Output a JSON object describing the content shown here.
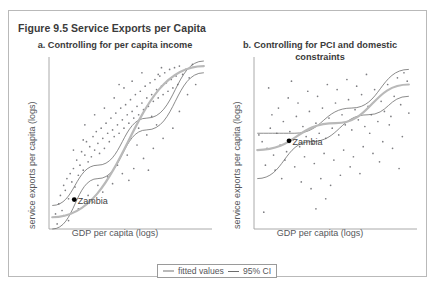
{
  "figure": {
    "title": "Figure 9.5 Service Exports per Capita",
    "border_color": "#b9b9b9"
  },
  "legend": {
    "fitted_label": "fitted values",
    "ci_label": "95% CI",
    "fitted_color": "#b9b9b9",
    "ci_color": "#6d6d6d"
  },
  "panels": [
    {
      "id": "a",
      "title": "a. Controlling for per capita income",
      "xlabel": "GDP per capita (logs)",
      "ylabel": "service exports per capita (logs)",
      "annotation": "Zambia"
    },
    {
      "id": "b",
      "title": "b. Controlling for PCI and domestic constraints",
      "xlabel": "GDP per capita (logs)",
      "ylabel": "service exports per capita (logs)",
      "annotation": "Zambia"
    }
  ],
  "chart_data": [
    {
      "type": "scatter",
      "panel": "a",
      "title": "a. Controlling for per capita income",
      "xlabel": "GDP per capita (logs)",
      "ylabel": "service exports per capita (logs)",
      "grid": false,
      "legend_position": "bottom-center",
      "xlim": [
        0,
        1
      ],
      "ylim": [
        0,
        1
      ],
      "points": [
        [
          0.04,
          0.09
        ],
        [
          0.06,
          0.15
        ],
        [
          0.07,
          0.2
        ],
        [
          0.08,
          0.11
        ],
        [
          0.09,
          0.26
        ],
        [
          0.1,
          0.23
        ],
        [
          0.11,
          0.3
        ],
        [
          0.12,
          0.18
        ],
        [
          0.13,
          0.33
        ],
        [
          0.14,
          0.28
        ],
        [
          0.15,
          0.36
        ],
        [
          0.16,
          0.25
        ],
        [
          0.17,
          0.41
        ],
        [
          0.18,
          0.32
        ],
        [
          0.19,
          0.38
        ],
        [
          0.2,
          0.46
        ],
        [
          0.21,
          0.35
        ],
        [
          0.22,
          0.44
        ],
        [
          0.23,
          0.52
        ],
        [
          0.24,
          0.4
        ],
        [
          0.25,
          0.49
        ],
        [
          0.26,
          0.43
        ],
        [
          0.27,
          0.55
        ],
        [
          0.28,
          0.47
        ],
        [
          0.29,
          0.58
        ],
        [
          0.3,
          0.51
        ],
        [
          0.31,
          0.45
        ],
        [
          0.32,
          0.6
        ],
        [
          0.33,
          0.54
        ],
        [
          0.34,
          0.48
        ],
        [
          0.35,
          0.63
        ],
        [
          0.36,
          0.57
        ],
        [
          0.37,
          0.52
        ],
        [
          0.38,
          0.66
        ],
        [
          0.39,
          0.59
        ],
        [
          0.4,
          0.55
        ],
        [
          0.41,
          0.69
        ],
        [
          0.42,
          0.62
        ],
        [
          0.43,
          0.57
        ],
        [
          0.44,
          0.72
        ],
        [
          0.45,
          0.65
        ],
        [
          0.46,
          0.6
        ],
        [
          0.47,
          0.74
        ],
        [
          0.48,
          0.68
        ],
        [
          0.49,
          0.63
        ],
        [
          0.5,
          0.77
        ],
        [
          0.51,
          0.7
        ],
        [
          0.52,
          0.66
        ],
        [
          0.53,
          0.8
        ],
        [
          0.54,
          0.73
        ],
        [
          0.55,
          0.68
        ],
        [
          0.56,
          0.82
        ],
        [
          0.57,
          0.75
        ],
        [
          0.58,
          0.71
        ],
        [
          0.59,
          0.85
        ],
        [
          0.6,
          0.78
        ],
        [
          0.61,
          0.73
        ],
        [
          0.62,
          0.87
        ],
        [
          0.63,
          0.8
        ],
        [
          0.64,
          0.76
        ],
        [
          0.65,
          0.89
        ],
        [
          0.66,
          0.83
        ],
        [
          0.67,
          0.78
        ],
        [
          0.68,
          0.91
        ],
        [
          0.69,
          0.85
        ],
        [
          0.7,
          0.8
        ],
        [
          0.71,
          0.93
        ],
        [
          0.72,
          0.87
        ],
        [
          0.73,
          0.82
        ],
        [
          0.74,
          0.95
        ],
        [
          0.75,
          0.89
        ],
        [
          0.76,
          0.84
        ],
        [
          0.77,
          0.96
        ],
        [
          0.78,
          0.91
        ],
        [
          0.79,
          0.86
        ],
        [
          0.8,
          0.97
        ],
        [
          0.82,
          0.92
        ],
        [
          0.84,
          0.95
        ],
        [
          0.86,
          0.9
        ],
        [
          0.88,
          0.98
        ],
        [
          0.12,
          0.05
        ],
        [
          0.18,
          0.12
        ],
        [
          0.24,
          0.2
        ],
        [
          0.3,
          0.26
        ],
        [
          0.36,
          0.31
        ],
        [
          0.42,
          0.38
        ],
        [
          0.48,
          0.44
        ],
        [
          0.54,
          0.5
        ],
        [
          0.6,
          0.56
        ],
        [
          0.66,
          0.62
        ],
        [
          0.22,
          0.62
        ],
        [
          0.28,
          0.68
        ],
        [
          0.34,
          0.72
        ],
        [
          0.4,
          0.78
        ],
        [
          0.46,
          0.84
        ],
        [
          0.52,
          0.36
        ],
        [
          0.58,
          0.42
        ],
        [
          0.64,
          0.48
        ],
        [
          0.7,
          0.54
        ],
        [
          0.76,
          0.6
        ],
        [
          0.33,
          0.22
        ],
        [
          0.39,
          0.27
        ],
        [
          0.45,
          0.33
        ],
        [
          0.51,
          0.88
        ],
        [
          0.57,
          0.93
        ],
        [
          0.15,
          0.47
        ],
        [
          0.21,
          0.53
        ],
        [
          0.27,
          0.16
        ],
        [
          0.63,
          0.67
        ],
        [
          0.69,
          0.96
        ],
        [
          0.05,
          0.03
        ],
        [
          0.09,
          0.08
        ],
        [
          0.8,
          0.7
        ],
        [
          0.85,
          0.8
        ],
        [
          0.9,
          0.86
        ],
        [
          0.43,
          0.86
        ],
        [
          0.49,
          0.29
        ],
        [
          0.55,
          0.6
        ],
        [
          0.61,
          0.35
        ],
        [
          0.67,
          0.92
        ]
      ],
      "highlight_point": {
        "label": "Zambia",
        "x": 0.155,
        "y": 0.175
      },
      "fitted_line": {
        "x": [
          0.02,
          0.95
        ],
        "y": [
          0.07,
          0.97
        ]
      },
      "ci_upper": {
        "x": [
          0.02,
          0.3,
          0.6,
          0.95
        ],
        "y": [
          0.14,
          0.38,
          0.66,
          1.0
        ]
      },
      "ci_lower": {
        "x": [
          0.02,
          0.3,
          0.6,
          0.95
        ],
        "y": [
          0.0,
          0.3,
          0.59,
          0.93
        ]
      }
    },
    {
      "type": "scatter",
      "panel": "b",
      "title": "b. Controlling for PCI and domestic constraints",
      "xlabel": "GDP per capita (logs)",
      "ylabel": "service exports per capita (logs)",
      "grid": false,
      "legend_position": "bottom-center",
      "xlim": [
        0,
        1
      ],
      "ylim": [
        0,
        1
      ],
      "points": [
        [
          0.05,
          0.52
        ],
        [
          0.08,
          0.48
        ],
        [
          0.1,
          0.6
        ],
        [
          0.12,
          0.44
        ],
        [
          0.14,
          0.57
        ],
        [
          0.16,
          0.5
        ],
        [
          0.18,
          0.64
        ],
        [
          0.2,
          0.46
        ],
        [
          0.22,
          0.58
        ],
        [
          0.24,
          0.53
        ],
        [
          0.26,
          0.67
        ],
        [
          0.28,
          0.49
        ],
        [
          0.3,
          0.61
        ],
        [
          0.32,
          0.55
        ],
        [
          0.34,
          0.7
        ],
        [
          0.36,
          0.51
        ],
        [
          0.38,
          0.63
        ],
        [
          0.4,
          0.57
        ],
        [
          0.42,
          0.72
        ],
        [
          0.44,
          0.54
        ],
        [
          0.46,
          0.66
        ],
        [
          0.48,
          0.6
        ],
        [
          0.5,
          0.75
        ],
        [
          0.52,
          0.56
        ],
        [
          0.54,
          0.68
        ],
        [
          0.56,
          0.62
        ],
        [
          0.58,
          0.77
        ],
        [
          0.6,
          0.59
        ],
        [
          0.62,
          0.71
        ],
        [
          0.64,
          0.65
        ],
        [
          0.66,
          0.8
        ],
        [
          0.68,
          0.61
        ],
        [
          0.7,
          0.73
        ],
        [
          0.72,
          0.68
        ],
        [
          0.74,
          0.83
        ],
        [
          0.76,
          0.64
        ],
        [
          0.78,
          0.76
        ],
        [
          0.8,
          0.7
        ],
        [
          0.82,
          0.86
        ],
        [
          0.84,
          0.67
        ],
        [
          0.86,
          0.79
        ],
        [
          0.88,
          0.9
        ],
        [
          0.9,
          0.74
        ],
        [
          0.92,
          0.93
        ],
        [
          0.94,
          0.88
        ],
        [
          0.07,
          0.38
        ],
        [
          0.13,
          0.35
        ],
        [
          0.19,
          0.41
        ],
        [
          0.25,
          0.37
        ],
        [
          0.31,
          0.43
        ],
        [
          0.37,
          0.39
        ],
        [
          0.43,
          0.45
        ],
        [
          0.49,
          0.41
        ],
        [
          0.55,
          0.47
        ],
        [
          0.61,
          0.43
        ],
        [
          0.67,
          0.49
        ],
        [
          0.73,
          0.45
        ],
        [
          0.79,
          0.52
        ],
        [
          0.85,
          0.48
        ],
        [
          0.91,
          0.55
        ],
        [
          0.15,
          0.72
        ],
        [
          0.21,
          0.78
        ],
        [
          0.27,
          0.75
        ],
        [
          0.33,
          0.82
        ],
        [
          0.39,
          0.79
        ],
        [
          0.45,
          0.86
        ],
        [
          0.51,
          0.83
        ],
        [
          0.57,
          0.89
        ],
        [
          0.63,
          0.85
        ],
        [
          0.69,
          0.92
        ],
        [
          0.29,
          0.28
        ],
        [
          0.35,
          0.24
        ],
        [
          0.41,
          0.3
        ],
        [
          0.47,
          0.26
        ],
        [
          0.53,
          0.32
        ],
        [
          0.11,
          0.68
        ],
        [
          0.17,
          0.3
        ],
        [
          0.23,
          0.88
        ],
        [
          0.59,
          0.37
        ],
        [
          0.65,
          0.33
        ],
        [
          0.03,
          0.56
        ],
        [
          0.06,
          0.1
        ],
        [
          0.38,
          0.12
        ],
        [
          0.44,
          0.18
        ],
        [
          0.71,
          0.57
        ],
        [
          0.77,
          0.4
        ],
        [
          0.83,
          0.62
        ],
        [
          0.89,
          0.36
        ],
        [
          0.95,
          0.69
        ],
        [
          0.09,
          0.84
        ]
      ],
      "highlight_point": {
        "label": "Zambia",
        "x": 0.215,
        "y": 0.525
      },
      "fitted_line": {
        "x": [
          0.02,
          0.5,
          0.95
        ],
        "y": [
          0.47,
          0.63,
          0.86
        ]
      },
      "ci_upper": {
        "x": [
          0.02,
          0.25,
          0.6,
          0.95
        ],
        "y": [
          0.57,
          0.57,
          0.72,
          0.95
        ]
      },
      "ci_lower": {
        "x": [
          0.02,
          0.35,
          0.7,
          0.95
        ],
        "y": [
          0.3,
          0.52,
          0.68,
          0.79
        ]
      }
    }
  ]
}
